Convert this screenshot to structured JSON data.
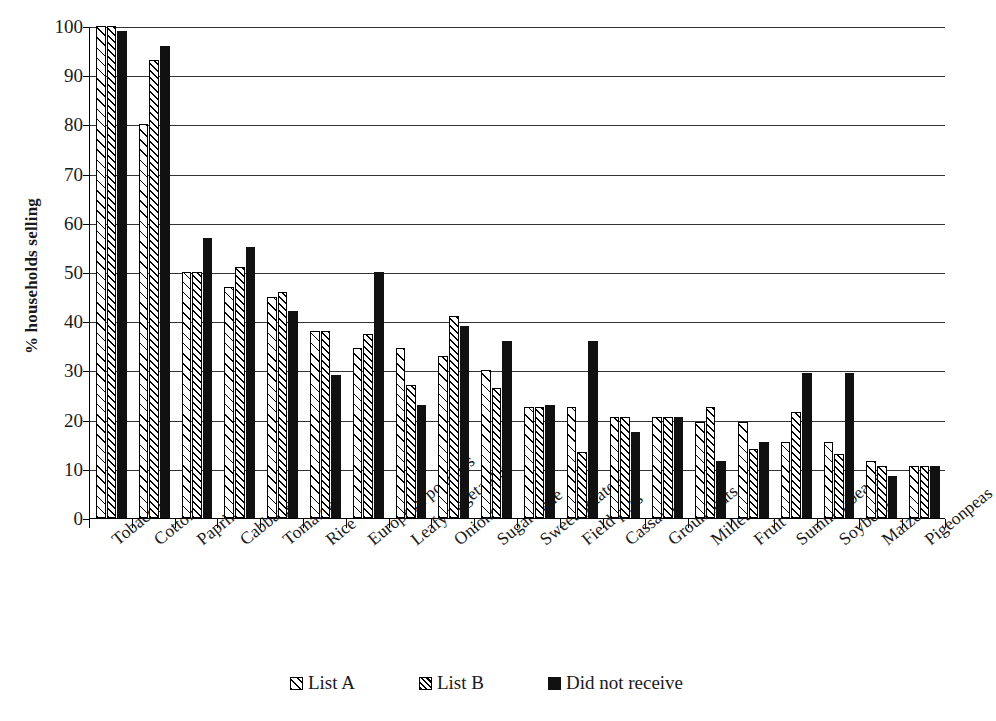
{
  "chart_data": {
    "type": "bar",
    "title": "",
    "xlabel": "",
    "ylabel": "% households selling",
    "ylim": [
      0,
      100
    ],
    "yticks": [
      0,
      10,
      20,
      30,
      40,
      50,
      60,
      70,
      80,
      90,
      100
    ],
    "grid": true,
    "legend_position": "bottom",
    "categories": [
      "Tobacco",
      "Cotton",
      "Paprika",
      "Cabbage",
      "Tomatoes",
      "Rice",
      "European potatoes",
      "Leafy vegetables",
      "Onions",
      "Sugar cane",
      "Sweet potatoes",
      "Field peas",
      "Cassava",
      "Groundnuts",
      "Millet",
      "Fruit",
      "Summer beans",
      "Soybeans",
      "Maize",
      "Pigeonpeas"
    ],
    "series": [
      {
        "name": "List A",
        "pattern": "light-diagonal-hatch",
        "values": [
          100,
          80,
          50,
          47,
          45,
          38,
          34.5,
          34.5,
          33,
          30,
          22.5,
          22.5,
          20.5,
          20.5,
          19.5,
          19.5,
          15.5,
          15.5,
          11.5,
          10.5
        ]
      },
      {
        "name": "List B",
        "pattern": "dense-diagonal-hatch",
        "values": [
          100,
          93,
          50,
          51,
          46,
          38,
          37.5,
          27,
          41,
          26.5,
          22.5,
          13.5,
          20.5,
          20.5,
          22.5,
          14,
          21.5,
          13,
          10.5,
          10.5
        ]
      },
      {
        "name": "Did not receive",
        "pattern": "solid-black",
        "values": [
          99,
          96,
          57,
          55,
          42,
          29,
          50,
          23,
          39,
          36,
          23,
          36,
          17.5,
          20.5,
          11.5,
          15.5,
          29.5,
          29.5,
          8.5,
          10.5
        ]
      }
    ]
  },
  "legend": {
    "items": [
      {
        "label": "List A",
        "swatch": "list-a"
      },
      {
        "label": "List B",
        "swatch": "list-b"
      },
      {
        "label": "Did not receive",
        "swatch": "no-receive"
      }
    ]
  },
  "colors": {
    "axis": "#000000",
    "grid": "#333333",
    "bar_fill_light": "#ffffff",
    "bar_fill_solid": "#111111",
    "text": "#1a1a1a"
  }
}
